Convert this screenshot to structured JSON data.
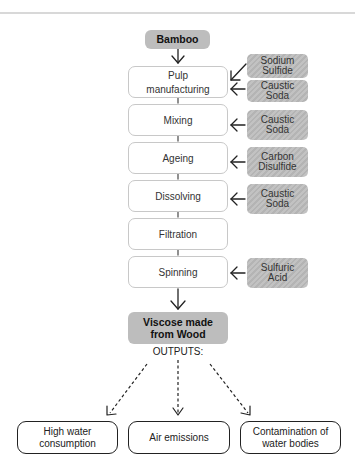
{
  "diagram": {
    "source": {
      "label": "Bamboo"
    },
    "steps": [
      {
        "label": "Pulp manufacturing",
        "line1": "Pulp",
        "line2": "manufacturing"
      },
      {
        "label": "Mixing"
      },
      {
        "label": "Ageing"
      },
      {
        "label": "Dissolving"
      },
      {
        "label": "Filtration"
      },
      {
        "label": "Spinning"
      }
    ],
    "chemicals": [
      {
        "line1": "Sodium",
        "line2": "Sulfide",
        "to_step": "Pulp manufacturing"
      },
      {
        "line1": "Caustic",
        "line2": "Soda",
        "to_step": "Pulp manufacturing"
      },
      {
        "line1": "Caustic",
        "line2": "Soda",
        "to_step": "Mixing"
      },
      {
        "line1": "Carbon",
        "line2": "Disulfide",
        "to_step": "Ageing"
      },
      {
        "line1": "Caustic",
        "line2": "Soda",
        "to_step": "Dissolving"
      },
      {
        "line1": "Sulfuric",
        "line2": "Acid",
        "to_step": "Spinning"
      }
    ],
    "product": {
      "line1": "Viscose made",
      "line2": "from Wood"
    },
    "outputs_label": "OUTPUTS:",
    "outputs": [
      {
        "line1": "High water",
        "line2": "consumption"
      },
      {
        "line1": "Air emissions"
      },
      {
        "line1": "Contamination of",
        "line2": "water bodies"
      }
    ]
  }
}
